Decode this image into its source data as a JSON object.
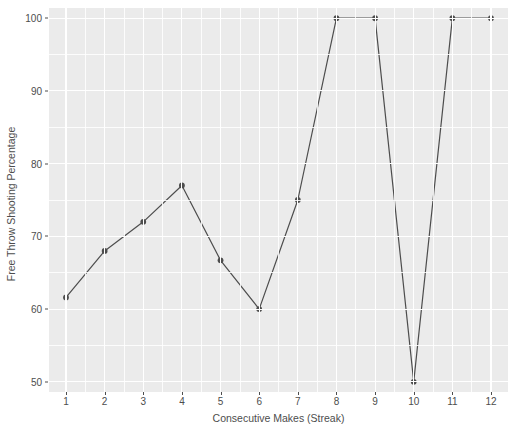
{
  "chart_data": {
    "type": "line",
    "title": "",
    "subtitle": "",
    "xlabel": "Consecutive Makes (Streak)",
    "ylabel": "Free Throw Shooting Percentage",
    "x": [
      1,
      2,
      3,
      4,
      5,
      6,
      7,
      8,
      9,
      10,
      11,
      12
    ],
    "values": [
      61.6,
      68.0,
      72.0,
      77.0,
      66.7,
      60.0,
      75.0,
      100.0,
      100.0,
      50.0,
      100.0,
      100.0
    ],
    "categories": [
      "1",
      "2",
      "3",
      "4",
      "5",
      "6",
      "7",
      "8",
      "9",
      "10",
      "11",
      "12"
    ],
    "xtick_labels": [
      "1",
      "2",
      "3",
      "4",
      "5",
      "6",
      "7",
      "8",
      "9",
      "10",
      "11",
      "12"
    ],
    "ytick_labels": [
      "50",
      "60",
      "70",
      "80",
      "90",
      "100"
    ],
    "yticks": [
      50,
      60,
      70,
      80,
      90,
      100
    ],
    "xlim": [
      0.56,
      12.44
    ],
    "ylim": [
      48.6,
      101.4
    ],
    "grid": true,
    "grid_minor": true,
    "legend": "none",
    "series_color": "#4d4d4d",
    "point_color": "#4d4d4d",
    "panel_background": "#ebebeb",
    "gridline_color": "#ffffff",
    "axis_text_color": "#4d4d4d",
    "line_width": 1.2,
    "point_size": 4.2
  }
}
